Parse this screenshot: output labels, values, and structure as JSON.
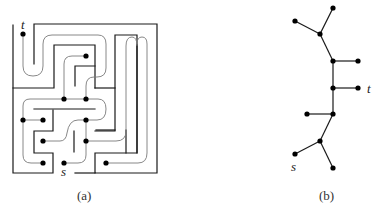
{
  "panels": [
    {
      "id": "a",
      "caption": "(a)",
      "description": "Maze with walls and a tree-shaped path through corridors",
      "labels": {
        "start": "s",
        "target": "t"
      }
    },
    {
      "id": "b",
      "caption": "(b)",
      "description": "Tree graph corresponding to the maze",
      "labels": {
        "start": "s",
        "target": "t"
      }
    }
  ],
  "colors": {
    "wall": "#1a1a1a",
    "path": "#7a7a7a",
    "node": "#000000"
  }
}
